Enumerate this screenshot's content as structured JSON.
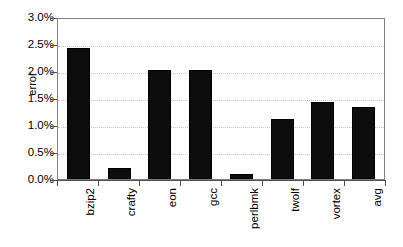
{
  "chart_data": {
    "type": "bar",
    "title": "",
    "xlabel": "",
    "ylabel": "error",
    "categories": [
      "bzip2",
      "crafty",
      "eon",
      "gcc",
      "perlbmk",
      "twolf",
      "vortex",
      "avg"
    ],
    "values": [
      2.42,
      0.21,
      2.01,
      2.02,
      0.1,
      1.11,
      1.42,
      1.33
    ],
    "value_unit": "%",
    "ylim": [
      0.0,
      3.0
    ],
    "ytick_values": [
      0.0,
      0.5,
      1.0,
      1.5,
      2.0,
      2.5,
      3.0
    ],
    "ytick_labels": [
      "0.0%",
      "0.5%",
      "1.0%",
      "1.5%",
      "2.0%",
      "2.5%",
      "3.0%"
    ],
    "grid": true,
    "grid_axis": "y",
    "legend": false,
    "legend_position": "none",
    "series": [
      {
        "name": "error",
        "values": [
          2.42,
          0.21,
          2.01,
          2.02,
          0.1,
          1.11,
          1.42,
          1.33
        ]
      }
    ]
  },
  "style": {
    "bar_color": "#0D0D0D",
    "bar_edge_color": "#000000",
    "background_color": "#FFFFFF",
    "plot_border_color": "#808080",
    "gridline_color": "#C8C8C8",
    "axis_color": "#4D4D4D",
    "text_color": "#000000"
  }
}
